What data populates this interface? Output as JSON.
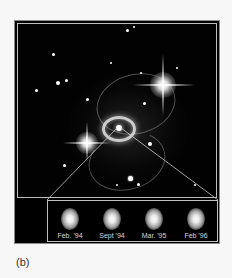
{
  "figure": {
    "panel_label": "(b)",
    "main_image": {
      "description": "Starfield with central ring structure and two bright stars with diffraction spikes",
      "icon": "supernova-ring-image"
    },
    "inset": {
      "epochs": [
        {
          "label": "Feb. '94"
        },
        {
          "label": "Sept '94"
        },
        {
          "label": "Mar. '95"
        },
        {
          "label": "Feb '96"
        }
      ]
    },
    "colors": {
      "background": "#f7f7f7",
      "image_bg": "#000000",
      "frame_line": "#bdbdbd",
      "label_text": "#d8d8d8"
    }
  }
}
